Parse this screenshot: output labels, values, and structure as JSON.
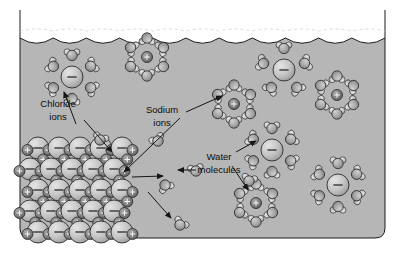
{
  "figure": {
    "background_color": "#ffffff",
    "solution_color": "#b6b6b6",
    "air_color": "#f2f2f2",
    "outline_color": "#1a1a1a"
  },
  "labels": {
    "chloride": {
      "line1": "Chloride",
      "line2": "ions",
      "x": 58,
      "y": 104
    },
    "sodium": {
      "line1": "Sodium",
      "line2": "ions",
      "x": 162,
      "y": 110
    },
    "water": {
      "line1": "Water",
      "line2": "molecules",
      "x": 219,
      "y": 157
    }
  },
  "legend_keys": {
    "chloride_sign": "–",
    "sodium_sign": "+",
    "water_label": "H2O"
  },
  "species": {
    "chloride_ion": {
      "name": "chloride-ion",
      "charge": "–",
      "radius": 11,
      "fill": "#c4c4c4"
    },
    "sodium_ion": {
      "name": "sodium-ion",
      "charge": "+",
      "radius": 5.5,
      "fill": "#7d7d7d"
    },
    "water_molecule": {
      "name": "water-molecule",
      "oxygen_radius": 5.2,
      "hydrogen_radius": 3.2,
      "fill": "#a3a3a3"
    }
  },
  "container": {
    "left": 20,
    "top": 10,
    "right": 385,
    "bottom": 238,
    "corner_radius": 10,
    "surface_y": 38,
    "wave_count": 11,
    "wave_amplitude": 5
  },
  "crystal": {
    "name": "sodium-chloride-crystal-lattice",
    "origin_x": 38,
    "origin_y": 148,
    "spacing": 21,
    "rows": 5,
    "cols": 5,
    "description": "Alternating lattice of large chloride ions and small sodium ions"
  },
  "hydrated_ions": [
    {
      "type": "chloride",
      "x": 72,
      "y": 77,
      "waters": 6,
      "name": "hydrated-chloride-ion-1"
    },
    {
      "type": "sodium",
      "x": 147,
      "y": 57,
      "waters": 6,
      "name": "hydrated-sodium-ion-1"
    },
    {
      "type": "sodium",
      "x": 234,
      "y": 104,
      "waters": 6,
      "name": "hydrated-sodium-ion-2"
    },
    {
      "type": "chloride",
      "x": 284,
      "y": 70,
      "waters": 5,
      "name": "hydrated-chloride-ion-2"
    },
    {
      "type": "sodium",
      "x": 337,
      "y": 95,
      "waters": 6,
      "name": "hydrated-sodium-ion-3"
    },
    {
      "type": "chloride",
      "x": 272,
      "y": 150,
      "waters": 6,
      "name": "hydrated-chloride-ion-3"
    },
    {
      "type": "sodium",
      "x": 256,
      "y": 203,
      "waters": 6,
      "name": "hydrated-sodium-ion-4"
    },
    {
      "type": "chloride",
      "x": 338,
      "y": 185,
      "waters": 6,
      "name": "hydrated-chloride-ion-4"
    }
  ],
  "free_water": [
    {
      "x": 100,
      "y": 140,
      "rot": 20,
      "name": "free-water-molecule-1"
    },
    {
      "x": 158,
      "y": 141,
      "rot": -30,
      "name": "free-water-molecule-2"
    },
    {
      "x": 165,
      "y": 185,
      "rot": 150,
      "name": "free-water-molecule-3"
    },
    {
      "x": 180,
      "y": 225,
      "rot": 35,
      "name": "free-water-molecule-4"
    },
    {
      "x": 196,
      "y": 171,
      "rot": -10,
      "name": "free-water-molecule-5"
    },
    {
      "x": 249,
      "y": 181,
      "rot": 15,
      "name": "free-water-molecule-6"
    }
  ],
  "arrows": [
    {
      "name": "arrow-chloride-to-hydrated-ion",
      "x1": 76,
      "y1": 124,
      "x2": 64,
      "y2": 92
    },
    {
      "name": "arrow-chloride-to-crystal",
      "x1": 84,
      "y1": 120,
      "x2": 112,
      "y2": 152
    },
    {
      "name": "arrow-sodium-to-hydrated-ion",
      "x1": 186,
      "y1": 112,
      "x2": 222,
      "y2": 96
    },
    {
      "name": "arrow-sodium-to-crystal",
      "x1": 180,
      "y1": 118,
      "x2": 124,
      "y2": 172
    },
    {
      "name": "arrow-crystal-to-solution",
      "x1": 132,
      "y1": 177,
      "x2": 163,
      "y2": 176
    },
    {
      "name": "arrow-water-leader",
      "x1": 196,
      "y1": 170,
      "x2": 178,
      "y2": 170
    },
    {
      "name": "arrow-water-to-upper-cluster",
      "x1": 236,
      "y1": 152,
      "x2": 256,
      "y2": 141
    },
    {
      "name": "arrow-water-to-lower-cluster",
      "x1": 232,
      "y1": 166,
      "x2": 248,
      "y2": 190
    },
    {
      "name": "arrow-crystal-to-free-water",
      "x1": 148,
      "y1": 192,
      "x2": 171,
      "y2": 218
    }
  ]
}
